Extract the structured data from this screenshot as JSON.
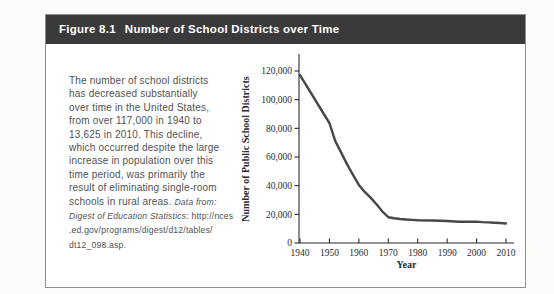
{
  "figure": {
    "label": "Figure 8.1",
    "title": "Number of School Districts over Time",
    "header_bg": "#3a3a3c",
    "header_text_color": "#ffffff",
    "border_color": "#8f8f8f"
  },
  "description": {
    "main_text": "The number of school districts\nhas decreased substantially\nover time in the United States,\nfrom over 117,000 in 1940 to\n13,625 in 2010. This decline,\nwhich occurred despite the large\nincrease in population over this\ntime period, was primarily the\nresult of eliminating single-room\nschools in rural areas. ",
    "citation_italic": "Data from:\nDigest of Education Statistics:",
    "citation_plain": " http://nces\n.ed.gov/programs/digest/d12/tables/\ndt12_098.asp."
  },
  "chart_data": {
    "type": "line",
    "title": "",
    "xlabel": "Year",
    "ylabel": "Number of Public School Districts",
    "x": [
      1940,
      1950,
      1952,
      1954,
      1956,
      1958,
      1960,
      1962,
      1964,
      1966,
      1968,
      1970,
      1972,
      1974,
      1976,
      1978,
      1980,
      1985,
      1990,
      1994,
      1996,
      1998,
      2000,
      2002,
      2004,
      2006,
      2008,
      2010
    ],
    "y": [
      117108,
      83718,
      71094,
      63057,
      54859,
      47594,
      40520,
      35676,
      31705,
      26983,
      22010,
      17995,
      17289,
      16730,
      16376,
      16112,
      15929,
      15700,
      15358,
      14881,
      14766,
      14805,
      14928,
      14559,
      14383,
      14166,
      13924,
      13625
    ],
    "xlim": [
      1940,
      2013
    ],
    "ylim": [
      0,
      131000
    ],
    "xticks": [
      1940,
      1950,
      1960,
      1970,
      1980,
      1990,
      2000,
      2010
    ],
    "yticks": [
      0,
      20000,
      40000,
      60000,
      80000,
      100000,
      120000
    ],
    "ytick_labels": [
      "0",
      "20,000",
      "40,000",
      "60,000",
      "80,000",
      "100,000",
      "120,000"
    ],
    "grid": false,
    "legend": false,
    "line_color": "#47474a"
  }
}
